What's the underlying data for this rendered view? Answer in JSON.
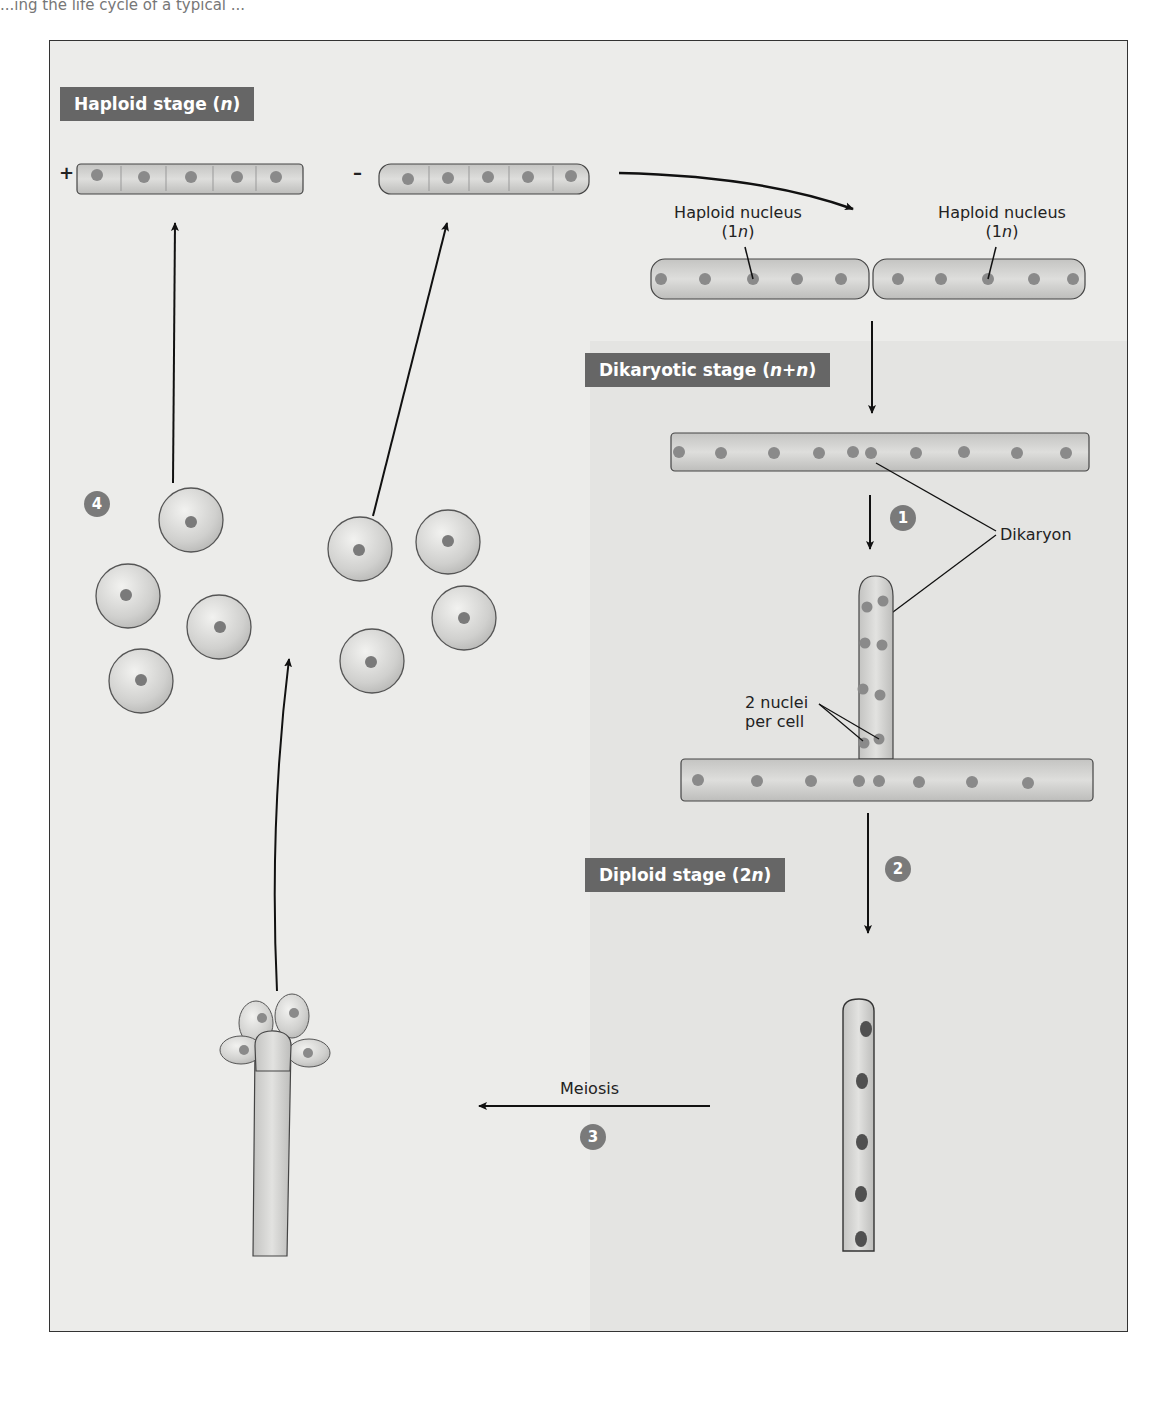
{
  "header": {
    "caption_fragment": "...ing the life cycle of a typical ..."
  },
  "stages": {
    "haploid": {
      "text": "Haploid stage (",
      "var": "n",
      "close": ")"
    },
    "dikaryotic": {
      "text": "Dikaryotic stage (",
      "var": "n+n",
      "close": ")"
    },
    "diploid": {
      "text": "Diploid stage (2",
      "var": "n",
      "close": ")"
    }
  },
  "mating_types": {
    "plus": "+",
    "minus": "–"
  },
  "labels": {
    "haploid_nucleus_left": {
      "line1": "Haploid nucleus",
      "line2_prefix": "(1",
      "line2_var": "n",
      "line2_suffix": ")"
    },
    "haploid_nucleus_right": {
      "line1": "Haploid nucleus",
      "line2_prefix": "(1",
      "line2_var": "n",
      "line2_suffix": ")"
    },
    "dikaryon": "Dikaryon",
    "two_nuclei_line1": "2 nuclei",
    "two_nuclei_line2": "per cell",
    "meiosis": "Meiosis"
  },
  "steps": [
    "1",
    "2",
    "3",
    "4"
  ],
  "colors": {
    "label_bg": "#666666",
    "step_bg": "#7a7a7a",
    "nucleus": "#8a8a8a",
    "diploid_nucleus": "#505050",
    "hypha_fill": "#d6d6d4",
    "outline": "#444444",
    "arrow": "#111111"
  }
}
